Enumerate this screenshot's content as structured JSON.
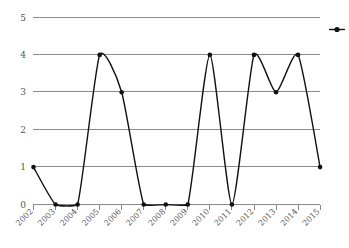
{
  "chart_data": {
    "type": "line",
    "title": "",
    "subtitle": "",
    "xlabel": "",
    "ylabel": "",
    "categories": [
      "2002",
      "2003",
      "2004",
      "2005",
      "2006",
      "2007",
      "2008",
      "2009",
      "2010",
      "2011",
      "2012",
      "2013",
      "2014",
      "2015"
    ],
    "values": [
      1,
      0,
      0,
      4,
      3,
      0,
      0,
      0,
      4,
      0,
      4,
      3,
      4,
      1
    ],
    "series": [
      {
        "name": "",
        "values": [
          1,
          0,
          0,
          4,
          3,
          0,
          0,
          0,
          4,
          0,
          4,
          3,
          4,
          1
        ]
      }
    ],
    "xlim": [
      "2002",
      "2015"
    ],
    "ylim": [
      0,
      5
    ],
    "yticks": [
      0,
      1,
      2,
      3,
      4,
      5
    ],
    "ytick_labels": [
      "0",
      "1",
      "2",
      "3",
      "4",
      "5"
    ],
    "xtick_labels": [
      "2002",
      "2003",
      "2004",
      "2005",
      "2006",
      "2007",
      "2008",
      "2009",
      "2010",
      "2011",
      "2012",
      "2013",
      "2014",
      "2015"
    ],
    "grid": true,
    "grid_axis": "y",
    "markers": "filled-circle",
    "interpolation": "smooth-spline",
    "legend": {
      "visible": true,
      "position": "right",
      "entries": [
        {
          "label": "",
          "marker": "line-with-dot"
        }
      ]
    },
    "colors": {
      "line": "#111111",
      "marker": "#111111",
      "grid": "#8a8a8a",
      "axis": "#8a8a8a",
      "tick_text": "#555555",
      "background": "#ffffff"
    }
  }
}
